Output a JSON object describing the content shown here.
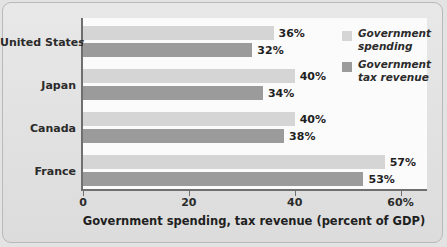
{
  "chart_data": {
    "type": "bar",
    "orientation": "horizontal",
    "title": "",
    "xlabel": "Government spending, tax revenue (percent of GDP)",
    "ylabel": "",
    "xlim": [
      0,
      65
    ],
    "xticks": [
      0,
      20,
      40,
      60
    ],
    "xtick_labels": [
      "0",
      "20",
      "40",
      "60%"
    ],
    "grid": false,
    "legend_position": "top-right",
    "categories": [
      "United States",
      "Japan",
      "Canada",
      "France"
    ],
    "series": [
      {
        "name": "Government spending",
        "color": "#d5d5d5",
        "values": [
          36,
          40,
          40,
          57
        ],
        "value_labels": [
          "36%",
          "40%",
          "40%",
          "57%"
        ]
      },
      {
        "name": "Government tax revenue",
        "color": "#9b9b9b",
        "values": [
          32,
          34,
          38,
          53
        ],
        "value_labels": [
          "32%",
          "34%",
          "38%",
          "53%"
        ]
      }
    ]
  },
  "legend": {
    "items": [
      {
        "label_line1": "Government",
        "label_line2": "spending",
        "swatch": "light"
      },
      {
        "label_line1": "Government",
        "label_line2": "tax revenue",
        "swatch": "dark"
      }
    ]
  },
  "colors": {
    "background": "#e3e3e3",
    "plot_background": "#fbfbfb",
    "axis": "#6f6f6f",
    "spending": "#d5d5d5",
    "tax_revenue": "#9b9b9b",
    "text": "#1f1f1f"
  }
}
